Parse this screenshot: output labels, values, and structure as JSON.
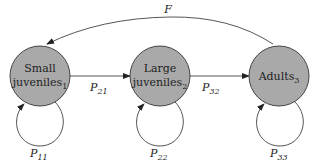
{
  "diagram": {
    "type": "stage-structured life cycle graph",
    "nodes": [
      {
        "id": "1",
        "line1": "Small",
        "line2": "juveniles",
        "sub": "1"
      },
      {
        "id": "2",
        "line1": "Large",
        "line2": "juveniles",
        "sub": "2"
      },
      {
        "id": "3",
        "line1": "",
        "line2": "Adults",
        "sub": "3"
      }
    ],
    "edges": [
      {
        "from": "1",
        "to": "2",
        "label": "P",
        "sub": "21"
      },
      {
        "from": "2",
        "to": "3",
        "label": "P",
        "sub": "32"
      },
      {
        "from": "3",
        "to": "1",
        "label": "F",
        "sub": ""
      },
      {
        "from": "1",
        "to": "1",
        "label": "P",
        "sub": "11"
      },
      {
        "from": "2",
        "to": "2",
        "label": "P",
        "sub": "22"
      },
      {
        "from": "3",
        "to": "3",
        "label": "P",
        "sub": "33"
      }
    ],
    "colors": {
      "node_fill": "#a9a9a9",
      "stroke": "#444444"
    }
  }
}
